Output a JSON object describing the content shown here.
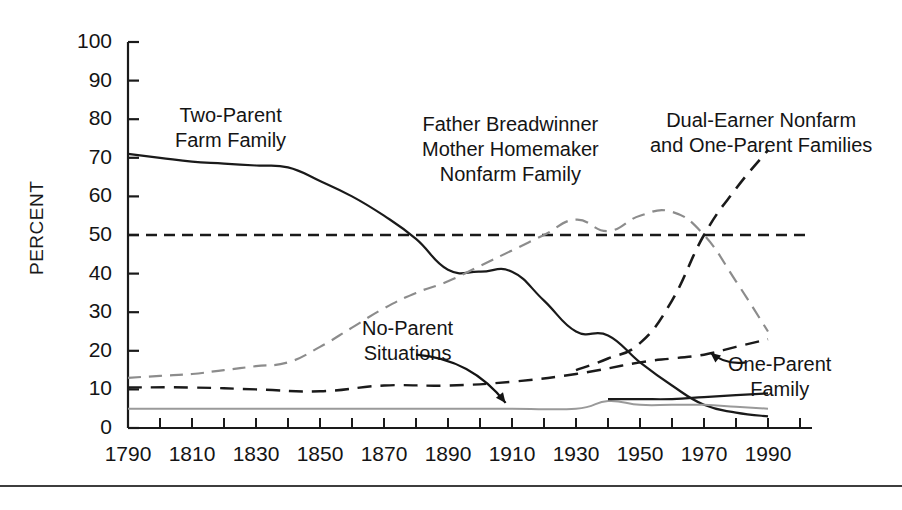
{
  "figure": {
    "y_axis_title": "PERCENT",
    "annotations": [
      {
        "name": "two-parent-farm-family",
        "lines": [
          "Two-Parent",
          "Farm Family"
        ],
        "x": 175,
        "y": 103
      },
      {
        "name": "father-breadwinner-nonfarm",
        "lines": [
          "Father Breadwinner",
          "Mother Homemaker",
          "Nonfarm Family"
        ],
        "x": 422,
        "y": 112
      },
      {
        "name": "dual-earner-and-one-parent",
        "lines": [
          "Dual-Earner Nonfarm",
          "and One-Parent Families"
        ],
        "x": 650,
        "y": 108
      },
      {
        "name": "no-parent-situations",
        "lines": [
          "No-Parent",
          "Situations"
        ],
        "x": 362,
        "y": 316
      },
      {
        "name": "one-parent-family",
        "lines": [
          "One-Parent",
          "Family"
        ],
        "x": 728,
        "y": 352
      }
    ]
  },
  "chart_data": {
    "type": "line",
    "title": "",
    "xlabel": "",
    "ylabel": "PERCENT",
    "xlim": [
      1790,
      2000
    ],
    "ylim": [
      0,
      100
    ],
    "grid": false,
    "legend": "annotations-inline",
    "x_major_ticks": [
      1790,
      1810,
      1830,
      1850,
      1870,
      1890,
      1910,
      1930,
      1950,
      1970,
      1990
    ],
    "x_minor_ticks": [
      1800,
      1820,
      1840,
      1860,
      1880,
      1900,
      1920,
      1940,
      1960,
      1980,
      2000
    ],
    "x_tick_labels": [
      "1790",
      "1810",
      "1830",
      "1850",
      "1870",
      "1890",
      "1910",
      "1930",
      "1950",
      "1970",
      "1990"
    ],
    "y_ticks": [
      0,
      10,
      20,
      30,
      40,
      50,
      60,
      70,
      80,
      90,
      100
    ],
    "y_tick_labels": [
      "0",
      "10",
      "20",
      "30",
      "40",
      "50",
      "60",
      "70",
      "80",
      "90",
      "100"
    ],
    "reference_line": {
      "name": "fifty-percent-reference",
      "value": 50,
      "style": "dashed",
      "color": "#1a1a1a"
    },
    "series": [
      {
        "name": "Two-Parent Farm Family",
        "style": "solid",
        "color": "#1a1a1a",
        "width": 2.2,
        "x": [
          1790,
          1800,
          1810,
          1820,
          1830,
          1840,
          1850,
          1860,
          1870,
          1880,
          1890,
          1900,
          1910,
          1920,
          1930,
          1940,
          1950,
          1960,
          1970,
          1980,
          1990
        ],
        "values": [
          71,
          70,
          69,
          68.5,
          68,
          67.5,
          64,
          60,
          55,
          49,
          41,
          40.5,
          40.5,
          33,
          25,
          24,
          17,
          11,
          6,
          4,
          3
        ]
      },
      {
        "name": "Father Breadwinner Mother Homemaker Nonfarm Family",
        "style": "dashed",
        "color": "#8c8c8c",
        "width": 2.2,
        "x": [
          1790,
          1800,
          1810,
          1820,
          1830,
          1840,
          1850,
          1860,
          1870,
          1880,
          1890,
          1900,
          1910,
          1920,
          1930,
          1940,
          1950,
          1960,
          1970,
          1980,
          1990
        ],
        "values": [
          13,
          13.5,
          14,
          15,
          16,
          17,
          21,
          26,
          31,
          35,
          38,
          42,
          46,
          50,
          54,
          51,
          55,
          56,
          50,
          38,
          25
        ]
      },
      {
        "name": "Dual-Earner Nonfarm and One-Parent Families",
        "style": "dashed",
        "color": "#1a1a1a",
        "width": 2.6,
        "x": [
          1930,
          1940,
          1950,
          1960,
          1970,
          1980,
          1990
        ],
        "values": [
          15,
          18,
          22,
          33,
          50,
          62,
          72
        ]
      },
      {
        "name": "No-Parent Situations",
        "style": "solid",
        "color": "#9a9a9a",
        "width": 2.0,
        "x": [
          1790,
          1810,
          1830,
          1850,
          1870,
          1890,
          1910,
          1930,
          1940,
          1950,
          1960,
          1970,
          1980,
          1990
        ],
        "values": [
          5,
          5,
          5,
          5,
          5,
          5,
          5,
          5,
          7,
          6,
          6,
          6,
          5.5,
          5
        ]
      },
      {
        "name": "No-Parent Situations Trend",
        "style": "dashed",
        "color": "#1a1a1a",
        "width": 2.4,
        "x": [
          1790,
          1810,
          1830,
          1850,
          1870,
          1890,
          1910,
          1930,
          1950,
          1960,
          1970,
          1980,
          1990
        ],
        "values": [
          10.5,
          10.5,
          10,
          9.5,
          11,
          11,
          12,
          14,
          17,
          18,
          19,
          21,
          23
        ]
      },
      {
        "name": "One-Parent Family",
        "style": "solid",
        "color": "#1a1a1a",
        "width": 2.2,
        "x": [
          1940,
          1950,
          1960,
          1970,
          1980,
          1990
        ],
        "values": [
          7.5,
          7.5,
          7.5,
          8,
          8.5,
          9
        ]
      }
    ],
    "arrows": [
      {
        "name": "no-parent-arrow",
        "from": [
          1880,
          19
        ],
        "to": [
          1908,
          6.5
        ]
      },
      {
        "name": "one-parent-arrow",
        "from": [
          1983,
          17
        ],
        "to": [
          1972,
          19.5
        ]
      }
    ]
  }
}
